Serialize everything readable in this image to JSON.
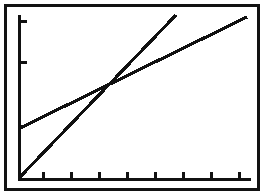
{
  "screen": {
    "device": "graphing-calculator",
    "title": "Graphing calculator plot of two intersecting lines",
    "background_color": "#ffffff",
    "ink_color": "#111111",
    "frame_color": "#121212",
    "width_px": 264,
    "height_px": 195
  },
  "axes": {
    "x_axis_label": "",
    "y_axis_label": "",
    "x_tick_count": 8,
    "y_tick_count": 2,
    "x_tick_positions_px": [
      31,
      59,
      87,
      115,
      143,
      171,
      199,
      227
    ],
    "y_tick_positions_px": [
      9,
      50
    ],
    "origin_px": {
      "x": 7,
      "y": 167
    },
    "grid": "off"
  },
  "chart_data": {
    "type": "line",
    "subtitle": "",
    "xlabel": "",
    "ylabel": "",
    "xlim": [
      0,
      10
    ],
    "ylim": [
      0,
      10
    ],
    "grid": false,
    "legend": "none",
    "annotations": [
      {
        "text": "intersection",
        "x": 4.6,
        "y": 4.9
      }
    ],
    "series": [
      {
        "name": "Steep line",
        "style": "dotted-pixel",
        "color": "#111111",
        "slope": 1.07,
        "intercept": 0.0,
        "x": [
          0,
          7.1
        ],
        "values": [
          0.0,
          7.6
        ],
        "pixel_start": {
          "x": 9,
          "y": 166
        },
        "pixel_end": {
          "x": 165,
          "y": 4
        }
      },
      {
        "name": "Shallow line",
        "style": "dotted-pixel",
        "color": "#111111",
        "slope": 0.47,
        "intercept": 2.5,
        "x": [
          0,
          10
        ],
        "values": [
          2.5,
          7.2
        ],
        "pixel_start": {
          "x": 9,
          "y": 117
        },
        "pixel_end": {
          "x": 236,
          "y": 6
        }
      }
    ]
  }
}
